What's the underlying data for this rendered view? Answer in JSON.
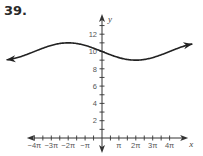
{
  "problem": {
    "number": "39."
  },
  "chart_data": {
    "type": "line",
    "title": "",
    "xlabel": "x",
    "ylabel": "y",
    "x_tick_labels": [
      "−4π",
      "−3π",
      "−2π",
      "−π",
      "π",
      "2π",
      "3π",
      "4π"
    ],
    "y_tick_labels": [
      "2",
      "4",
      "6",
      "8",
      "10",
      "12"
    ],
    "x_tick_step": "π/2",
    "y_tick_step": 1,
    "xlim": [
      "−4.5π",
      "4.8π"
    ],
    "ylim": [
      0,
      14
    ],
    "grid": false,
    "series": [
      {
        "name": "curve",
        "description": "sinusoid with midline y=10, amplitude 1, period 8π, decreasing through (0,10); arrows on both ends",
        "points_x_in_pi": [
          -5.8,
          -4,
          -2,
          0,
          2,
          4,
          5.8
        ],
        "points_y": [
          9.4,
          10,
          11,
          10,
          9,
          10,
          10.6
        ]
      }
    ]
  },
  "colors": {
    "curve": "#222222",
    "axis": "#333333",
    "text": "#555555"
  }
}
